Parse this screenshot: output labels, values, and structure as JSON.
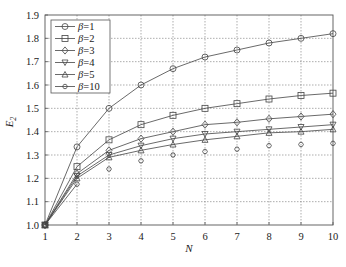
{
  "chart_data": {
    "type": "line",
    "title": "",
    "xlabel": "N",
    "ylabel": "E",
    "ylabel_sub": "2",
    "xlim": [
      1,
      10
    ],
    "ylim": [
      1.0,
      1.9
    ],
    "xticks": [
      "1",
      "2",
      "3",
      "4",
      "5",
      "6",
      "7",
      "8",
      "9",
      "10"
    ],
    "yticks": [
      "1.0",
      "1.1",
      "1.2",
      "1.3",
      "1.4",
      "1.5",
      "1.6",
      "1.7",
      "1.8",
      "1.9"
    ],
    "grid": true,
    "legend_position": "top-left",
    "x": [
      1,
      2,
      3,
      4,
      5,
      6,
      7,
      8,
      9,
      10
    ],
    "series": [
      {
        "name": "β=1",
        "label_sym": "β",
        "label_val": "=1",
        "marker": "circle",
        "connected": true,
        "values": [
          1.0,
          1.335,
          1.5,
          1.6,
          1.67,
          1.72,
          1.75,
          1.78,
          1.8,
          1.82
        ]
      },
      {
        "name": "β=2",
        "label_sym": "β",
        "label_val": "=2",
        "marker": "square",
        "connected": true,
        "values": [
          1.0,
          1.25,
          1.365,
          1.43,
          1.47,
          1.5,
          1.52,
          1.54,
          1.555,
          1.565
        ]
      },
      {
        "name": "β=3",
        "label_sym": "β",
        "label_val": "=3",
        "marker": "diamond",
        "connected": true,
        "values": [
          1.0,
          1.22,
          1.32,
          1.37,
          1.4,
          1.43,
          1.44,
          1.455,
          1.465,
          1.475
        ]
      },
      {
        "name": "β=4",
        "label_sym": "β",
        "label_val": "=4",
        "marker": "triangle-down",
        "connected": true,
        "values": [
          1.0,
          1.21,
          1.3,
          1.34,
          1.37,
          1.39,
          1.4,
          1.41,
          1.42,
          1.43
        ]
      },
      {
        "name": "β=5",
        "label_sym": "β",
        "label_val": "=5",
        "marker": "triangle-up",
        "connected": true,
        "values": [
          1.0,
          1.2,
          1.29,
          1.32,
          1.345,
          1.365,
          1.38,
          1.395,
          1.4,
          1.41
        ]
      },
      {
        "name": "β=10",
        "label_sym": "β",
        "label_val": "=10",
        "marker": "hexagon",
        "connected": false,
        "values": [
          1.0,
          1.175,
          1.24,
          1.275,
          1.3,
          1.315,
          1.325,
          1.34,
          1.345,
          1.35
        ]
      }
    ]
  }
}
